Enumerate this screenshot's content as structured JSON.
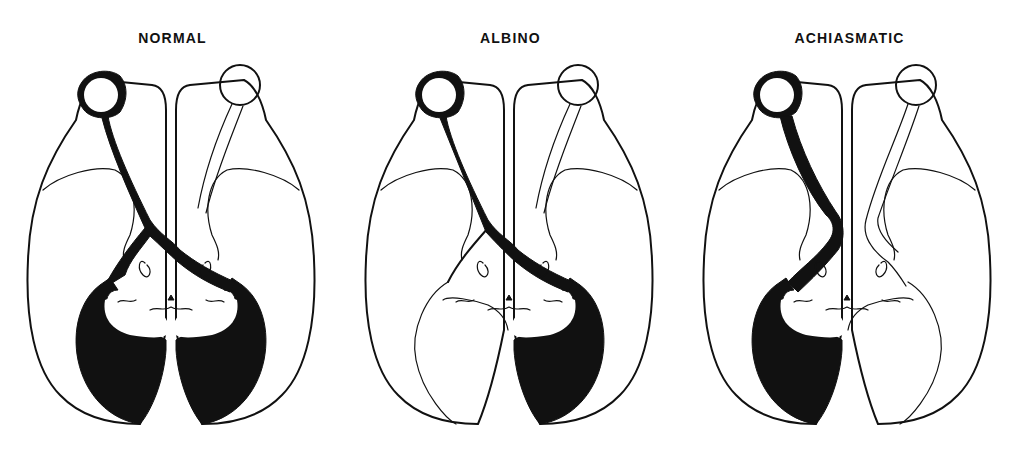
{
  "figure": {
    "panels": [
      {
        "id": "normal",
        "title": "NORMAL",
        "pathway": "partially crossed; projection fills both hemispheres"
      },
      {
        "id": "albino",
        "title": "ALBINO",
        "pathway": "predominantly crossed; projection fills contralateral (right) hemisphere"
      },
      {
        "id": "achiasmatic",
        "title": "ACHIASMATIC",
        "pathway": "uncrossed; projection fills ipsilateral (left) hemisphere"
      }
    ]
  },
  "colors": {
    "ink": "#111111",
    "background": "#ffffff"
  }
}
